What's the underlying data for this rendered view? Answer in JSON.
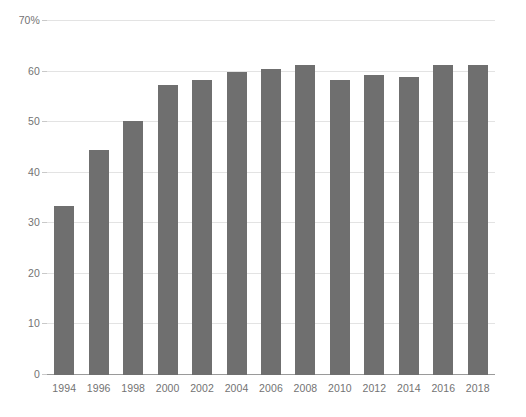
{
  "chart_data": {
    "type": "bar",
    "title": "",
    "subtitle": "",
    "xlabel": "",
    "ylabel": "",
    "categories": [
      "1994",
      "1996",
      "1998",
      "2000",
      "2002",
      "2004",
      "2006",
      "2008",
      "2010",
      "2012",
      "2014",
      "2016",
      "2018"
    ],
    "values": [
      33.4,
      44.5,
      50.2,
      57.3,
      58.3,
      60.0,
      60.6,
      61.3,
      58.3,
      59.3,
      58.9,
      61.3,
      61.3
    ],
    "series": [
      {
        "name": "",
        "values": [
          33.4,
          44.5,
          50.2,
          57.3,
          58.3,
          60.0,
          60.6,
          61.3,
          58.3,
          59.3,
          58.9,
          61.3,
          61.3
        ]
      }
    ],
    "ylim": [
      0,
      70
    ],
    "yticks": [
      0,
      10,
      20,
      30,
      40,
      50,
      60,
      70
    ],
    "ytick_labels": [
      "0",
      "10",
      "20",
      "30",
      "40",
      "50",
      "60",
      "70%"
    ],
    "xtick_labels": [
      "1994",
      "1996",
      "1998",
      "2000",
      "2002",
      "2004",
      "2006",
      "2008",
      "2010",
      "2012",
      "2014",
      "2016",
      "2018"
    ],
    "grid": true,
    "legend": false,
    "legend_position": "none",
    "annotations": [],
    "colors": {
      "bar": "#6f6f6f",
      "gridline": "#e3e3e3",
      "axis": "#9a9a9a",
      "tick_label": "#737373",
      "background": "#ffffff"
    }
  }
}
